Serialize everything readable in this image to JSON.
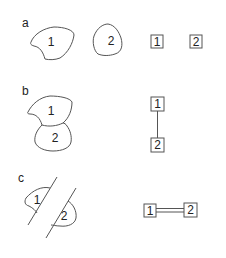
{
  "panels": [
    {
      "label": "a",
      "regions": [
        "1",
        "2"
      ],
      "relation": "disjoint",
      "graph": {
        "nodes": [
          "1",
          "2"
        ],
        "edge": "none"
      }
    },
    {
      "label": "b",
      "regions": [
        "1",
        "2"
      ],
      "relation": "overlapping / touching",
      "graph": {
        "nodes": [
          "1",
          "2"
        ],
        "edge": "single"
      }
    },
    {
      "label": "c",
      "regions": [
        "1",
        "2"
      ],
      "relation": "separated by shared boundary line",
      "graph": {
        "nodes": [
          "1",
          "2"
        ],
        "edge": "double"
      }
    }
  ],
  "colors": {
    "stroke": "#555555",
    "text": "#222222",
    "background": "#ffffff"
  }
}
